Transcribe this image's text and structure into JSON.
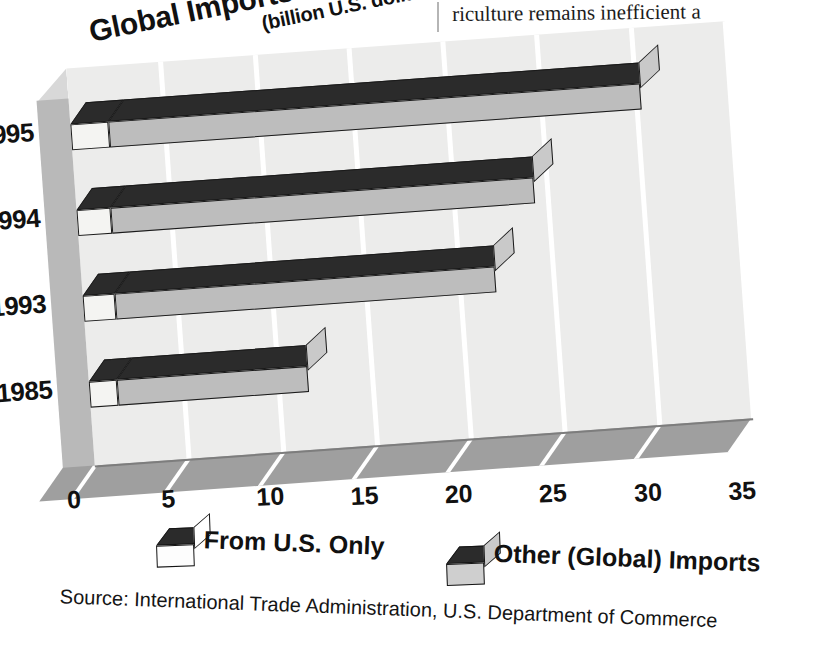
{
  "page": {
    "body_text_fragment": "riculture remains inefficient a"
  },
  "chart_data": {
    "type": "bar",
    "orientation": "horizontal",
    "stacked": true,
    "style": "3d",
    "title": "Global Imports and Imports from U.S.",
    "subtitle": "(billion U.S. dollars)",
    "xlabel": "",
    "ylabel": "",
    "units": "billion U.S. dollars",
    "categories": [
      "1995",
      "1994",
      "1993",
      "1985"
    ],
    "xticks": [
      "0",
      "5",
      "10",
      "15",
      "20",
      "25",
      "30",
      "35"
    ],
    "xlim": [
      0,
      35
    ],
    "grid": true,
    "legend_position": "bottom",
    "series": [
      {
        "name": "From U.S. Only",
        "color": "#f4f4f2",
        "values": [
          2.0,
          1.8,
          1.7,
          1.5
        ]
      },
      {
        "name": "Other (Global) Imports",
        "color": "#bdbdbd",
        "values": [
          28.3,
          22.5,
          20.2,
          10.1
        ]
      }
    ],
    "totals": [
      30.3,
      24.3,
      21.9,
      11.6
    ],
    "source": "Source: International Trade Administration, U.S. Department of Commerce"
  },
  "legend": {
    "items": [
      {
        "label": "From U.S. Only"
      },
      {
        "label": "Other (Global) Imports"
      }
    ]
  }
}
